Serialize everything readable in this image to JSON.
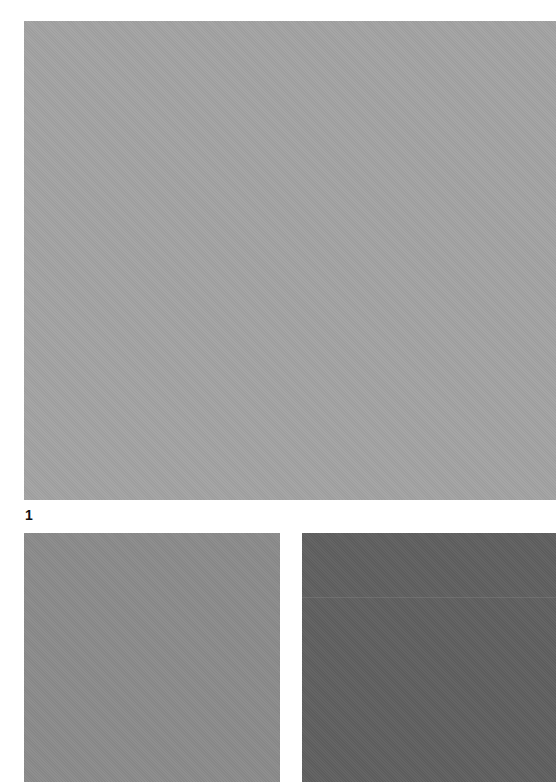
{
  "figure": {
    "label": "1",
    "swatches": {
      "main": {
        "color": "#a3a3a3"
      },
      "left": {
        "color": "#8b8b8b"
      },
      "right": {
        "color": "#606060",
        "line_color": "#8a8a8a"
      }
    }
  }
}
